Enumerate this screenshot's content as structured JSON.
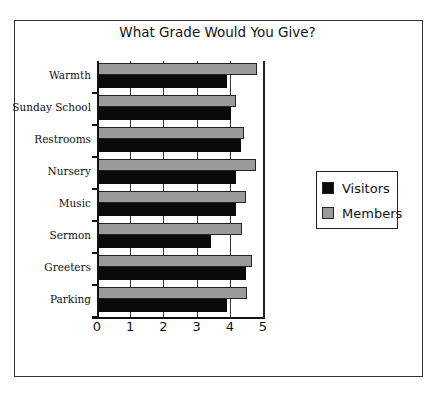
{
  "chart_data": {
    "type": "bar",
    "orientation": "horizontal",
    "title": "What Grade Would You Give?",
    "xlabel": "",
    "ylabel": "",
    "xlim": [
      0,
      5
    ],
    "x_ticks": [
      "0",
      "1",
      "2",
      "3",
      "4",
      "5"
    ],
    "categories": [
      "Warmth",
      "Sunday School",
      "Restrooms",
      "Nursery",
      "Music",
      "Sermon",
      "Greeters",
      "Parking"
    ],
    "series": [
      {
        "name": "Visitors",
        "color": "#0a0a0a",
        "values": [
          3.9,
          4.0,
          4.3,
          4.15,
          4.15,
          3.4,
          4.45,
          3.9
        ]
      },
      {
        "name": "Members",
        "color": "#9a9a9a",
        "values": [
          4.8,
          4.15,
          4.4,
          4.75,
          4.45,
          4.35,
          4.65,
          4.5
        ]
      }
    ],
    "legend_position": "right",
    "grid": true
  },
  "legend": {
    "items": [
      {
        "label": "Visitors",
        "color": "#0a0a0a"
      },
      {
        "label": "Members",
        "color": "#9a9a9a"
      }
    ]
  }
}
